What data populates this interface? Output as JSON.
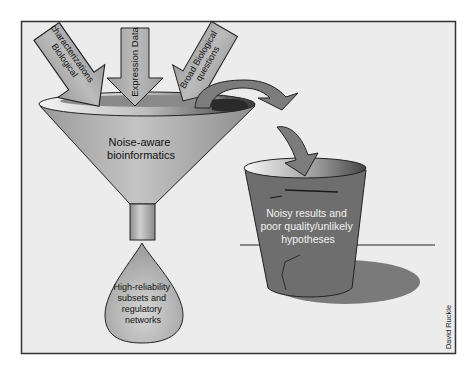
{
  "diagram": {
    "inputs": [
      {
        "id": "biological-characterizations",
        "label_line1": "Biological",
        "label_line2": "characterizations"
      },
      {
        "id": "expression-data",
        "label_line1": "Expression Data"
      },
      {
        "id": "broad-biological-questions",
        "label_line1": "Broad Biological",
        "label_line2": "questions"
      }
    ],
    "funnel": {
      "label_line1": "Noise-aware",
      "label_line2": "bioinformatics"
    },
    "drop": {
      "label_line1": "High-reliability",
      "label_line2": "subsets and",
      "label_line3": "regulatory",
      "label_line4": "networks"
    },
    "bucket": {
      "label_line1": "Noisy results and",
      "label_line2": "poor quality/unlikely",
      "label_line3": "hypotheses"
    },
    "credit": "David Ruckle",
    "colors": {
      "frame_bg": "#ececec",
      "frame_border": "#333333",
      "arrow_fill": "#a8a8a8",
      "funnel_fill": "#b4b4b4",
      "bucket_fill": "#6e6e6e",
      "shadow": "#7a7a7a",
      "curved_arrow": "#7c7c7c"
    }
  }
}
